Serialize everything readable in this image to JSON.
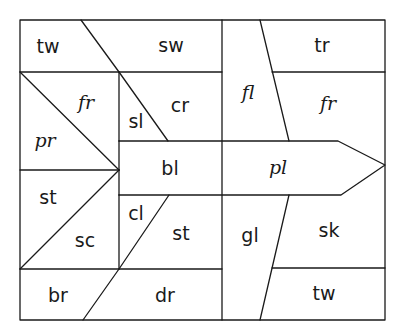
{
  "diagram": {
    "type": "word-puzzle-grid",
    "colors": {
      "line": "#1a1a1a",
      "background": "#ffffff"
    },
    "cells": [
      {
        "id": "tw_top",
        "label": "tw",
        "region": "top-left"
      },
      {
        "id": "sw",
        "label": "sw",
        "region": "top-middle"
      },
      {
        "id": "fr_left",
        "label": "fr",
        "region": "left-upper-triangle"
      },
      {
        "id": "pr",
        "label": "pr",
        "region": "left-lower-triangle"
      },
      {
        "id": "sl",
        "label": "sl",
        "region": "center-left-triangle"
      },
      {
        "id": "cr",
        "label": "cr",
        "region": "center-right"
      },
      {
        "id": "bl",
        "label": "bl",
        "region": "arrow-left"
      },
      {
        "id": "st_left",
        "label": "st",
        "region": "left-lower-upper-triangle"
      },
      {
        "id": "sc",
        "label": "sc",
        "region": "left-lower-lower-triangle"
      },
      {
        "id": "cl",
        "label": "cl",
        "region": "center-lower-left"
      },
      {
        "id": "st_center",
        "label": "st",
        "region": "center-lower-right"
      },
      {
        "id": "br",
        "label": "br",
        "region": "bottom-left"
      },
      {
        "id": "dr",
        "label": "dr",
        "region": "bottom-middle"
      },
      {
        "id": "fl",
        "label": "fl",
        "region": "right-column-upper"
      },
      {
        "id": "tr",
        "label": "tr",
        "region": "top-right"
      },
      {
        "id": "fr_right",
        "label": "fr",
        "region": "right-upper"
      },
      {
        "id": "pl",
        "label": "pl",
        "region": "arrow-right"
      },
      {
        "id": "gl",
        "label": "gl",
        "region": "right-column-lower"
      },
      {
        "id": "sk",
        "label": "sk",
        "region": "right-lower"
      },
      {
        "id": "tw_bottom",
        "label": "tw",
        "region": "bottom-right"
      }
    ]
  }
}
